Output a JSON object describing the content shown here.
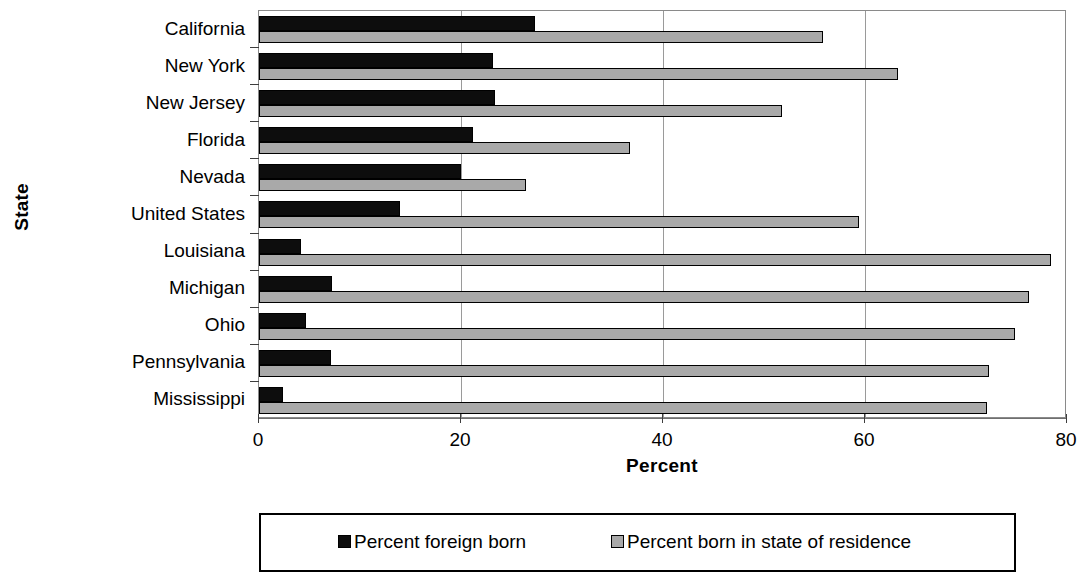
{
  "chart_data": {
    "type": "bar",
    "orientation": "horizontal",
    "title": "",
    "xlabel": "Percent",
    "ylabel": "State",
    "xlim": [
      0,
      80
    ],
    "xticks": [
      0,
      20,
      40,
      60,
      80
    ],
    "xtick_labels": [
      "0",
      "20",
      "40",
      "60",
      "80"
    ],
    "grid": "vertical gridlines at 20, 40, 60",
    "legend_position": "below plot, boxed, horizontal",
    "categories": [
      "California",
      "New York",
      "New Jersey",
      "Florida",
      "Nevada",
      "United States",
      "Louisiana",
      "Michigan",
      "Ohio",
      "Pennsylvania",
      "Mississippi"
    ],
    "series": [
      {
        "name": "Percent foreign born",
        "color": "#0d0d0d",
        "values": [
          27.3,
          23.2,
          23.4,
          21.2,
          20.0,
          14.0,
          4.2,
          7.2,
          4.7,
          7.1,
          2.4
        ]
      },
      {
        "name": "Percent born in state of residence",
        "color": "#a9a9a9",
        "values": [
          55.8,
          63.3,
          51.8,
          36.7,
          26.4,
          59.4,
          78.4,
          76.2,
          74.9,
          72.3,
          72.1
        ]
      }
    ]
  },
  "legend": {
    "entries": [
      {
        "label": "Percent foreign born"
      },
      {
        "label": "Percent born in state of residence"
      }
    ]
  },
  "axes": {
    "x_title": "Percent",
    "y_title": "State"
  }
}
